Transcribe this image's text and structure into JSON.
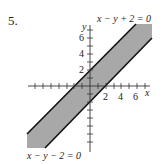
{
  "problem_number": "5.",
  "axes": {
    "x_label": "x",
    "y_label": "y",
    "x_ticks": [
      "2",
      "4",
      "6"
    ],
    "y_ticks": [
      "2",
      "4",
      "6"
    ]
  },
  "lines": {
    "upper": "x − y + 2 = 0",
    "lower": "x − y − 2 = 0"
  },
  "colors": {
    "band_fill": "#a8a8a8",
    "line": "#111111",
    "axis": "#333333"
  }
}
